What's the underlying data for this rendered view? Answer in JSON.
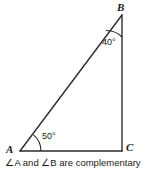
{
  "figure": {
    "caption": "∠A and ∠B are complementary",
    "stroke_color": "#2b2b2b",
    "text_color": "#1a1a1a",
    "background_color": "#ffffff",
    "vertices": [
      {
        "name": "A",
        "label": "A",
        "x": 20,
        "y": 151
      },
      {
        "name": "B",
        "label": "B",
        "x": 122,
        "y": 15
      },
      {
        "name": "C",
        "label": "C",
        "x": 122,
        "y": 151
      }
    ],
    "sides": [
      {
        "name": "hypotenuse-AB",
        "from": "A",
        "to": "B"
      },
      {
        "name": "leg-BC",
        "from": "B",
        "to": "C"
      },
      {
        "name": "leg-AC",
        "from": "A",
        "to": "C"
      }
    ],
    "angles": [
      {
        "vertex": "A",
        "label": "50°",
        "value": 50,
        "unit": "degrees"
      },
      {
        "vertex": "B",
        "label": "40°",
        "value": 40,
        "unit": "degrees"
      },
      {
        "vertex": "C",
        "label": "",
        "value": 90,
        "unit": "degrees"
      }
    ]
  }
}
